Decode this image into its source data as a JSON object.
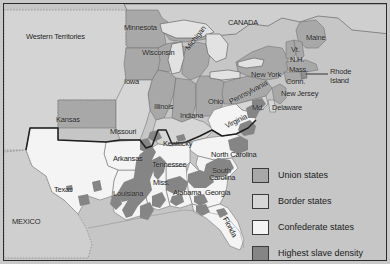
{
  "map": {
    "title": "Union, Border and Confederate States with Highest Slave Density",
    "colors": {
      "background": "#c9c9c9",
      "ocean": "#c6c6c6",
      "union": "#a8a8a8",
      "border": "#d6d6d6",
      "confederate": "#f2f2f2",
      "slave_density": "#8a8a8a",
      "territory": "#d4d4d4",
      "foreign": "#cfcfcf",
      "outline": "#4a4a4a",
      "heavy_outline": "#1f1f1f",
      "frame": "#2b2b2b",
      "text": "#1a1a1a"
    },
    "regions": [
      {
        "name": "Western Territories",
        "label": "Western Territories",
        "class": "territory"
      },
      {
        "name": "Canada",
        "label": "CANADA",
        "class": "foreign"
      },
      {
        "name": "Mexico",
        "label": "MEXICO",
        "class": "foreign"
      }
    ],
    "labels": [
      {
        "name": "western-territories",
        "text": "Western Territories",
        "x": 26,
        "y": 33,
        "size": 7.5,
        "rotate": 0
      },
      {
        "name": "canada",
        "text": "CANADA",
        "x": 228,
        "y": 19,
        "size": 7.5,
        "rotate": 0
      },
      {
        "name": "mexico",
        "text": "MEXICO",
        "x": 12,
        "y": 218,
        "size": 7.5,
        "rotate": 0
      },
      {
        "name": "minnesota",
        "text": "Minnesota",
        "x": 124,
        "y": 24,
        "size": 7.5,
        "rotate": 0
      },
      {
        "name": "wisconsin",
        "text": "Wisconsin",
        "x": 142,
        "y": 49,
        "size": 7.5,
        "rotate": 0
      },
      {
        "name": "michigan",
        "text": "Michigan",
        "x": 184,
        "y": 47,
        "size": 7.5,
        "rotate": -52
      },
      {
        "name": "iowa",
        "text": "Iowa",
        "x": 124,
        "y": 78,
        "size": 7.5,
        "rotate": 0
      },
      {
        "name": "illinois",
        "text": "Illinois",
        "x": 154,
        "y": 103,
        "size": 7.5,
        "rotate": 0
      },
      {
        "name": "indiana",
        "text": "Indiana",
        "x": 180,
        "y": 112,
        "size": 7.5,
        "rotate": 0
      },
      {
        "name": "ohio",
        "text": "Ohio",
        "x": 208,
        "y": 98,
        "size": 7.5,
        "rotate": 0
      },
      {
        "name": "kansas",
        "text": "Kansas",
        "x": 56,
        "y": 116,
        "size": 7.5,
        "rotate": 0
      },
      {
        "name": "missouri",
        "text": "Missouri",
        "x": 110,
        "y": 128,
        "size": 7.5,
        "rotate": 0
      },
      {
        "name": "kentucky",
        "text": "Kentucky",
        "x": 163,
        "y": 140,
        "size": 7.5,
        "rotate": 0
      },
      {
        "name": "tennessee",
        "text": "Tennessee",
        "x": 152,
        "y": 161,
        "size": 7.5,
        "rotate": 0
      },
      {
        "name": "arkansas",
        "text": "Arkansas",
        "x": 113,
        "y": 155,
        "size": 7.5,
        "rotate": 0
      },
      {
        "name": "texas",
        "text": "Texas",
        "x": 54,
        "y": 186,
        "size": 7.5,
        "rotate": 0
      },
      {
        "name": "louisiana",
        "text": "Louisiana",
        "x": 113,
        "y": 190,
        "size": 7.5,
        "rotate": 0
      },
      {
        "name": "mississippi",
        "text": "Miss.",
        "x": 153,
        "y": 179,
        "size": 7.5,
        "rotate": 0
      },
      {
        "name": "alabama",
        "text": "Alabama",
        "x": 173,
        "y": 189,
        "size": 7.5,
        "rotate": 0
      },
      {
        "name": "georgia",
        "text": "Georgia",
        "x": 205,
        "y": 189,
        "size": 7.5,
        "rotate": 0
      },
      {
        "name": "florida",
        "text": "Florida",
        "x": 228,
        "y": 216,
        "size": 7.5,
        "rotate": 62
      },
      {
        "name": "north-carolina",
        "text": "North Carolina",
        "x": 211,
        "y": 151,
        "size": 7.5,
        "rotate": 0
      },
      {
        "name": "south-carolina-line1",
        "text": "South",
        "x": 212,
        "y": 167,
        "size": 7.5,
        "rotate": 0
      },
      {
        "name": "south-carolina-line2",
        "text": "Carolina",
        "x": 209,
        "y": 174,
        "size": 7.5,
        "rotate": 0
      },
      {
        "name": "virginia",
        "text": "Virginia",
        "x": 224,
        "y": 123,
        "size": 7.5,
        "rotate": -26
      },
      {
        "name": "pennsylvania",
        "text": "Pennsylvania",
        "x": 228,
        "y": 99,
        "size": 7.5,
        "rotate": -28
      },
      {
        "name": "new-york",
        "text": "New York",
        "x": 251,
        "y": 71,
        "size": 7.5,
        "rotate": 0
      },
      {
        "name": "maine",
        "text": "Maine",
        "x": 306,
        "y": 34,
        "size": 7.5,
        "rotate": 0
      },
      {
        "name": "vermont",
        "text": "Vt.",
        "x": 291,
        "y": 46,
        "size": 7.5,
        "rotate": 0
      },
      {
        "name": "new-hampshire",
        "text": "N.H.",
        "x": 290,
        "y": 56,
        "size": 7.5,
        "rotate": 0
      },
      {
        "name": "massachusetts",
        "text": "Mass.",
        "x": 289,
        "y": 66,
        "size": 7.5,
        "rotate": 0
      },
      {
        "name": "connecticut",
        "text": "Conn.",
        "x": 286,
        "y": 78,
        "size": 7.5,
        "rotate": 0
      },
      {
        "name": "rhode-island-line1",
        "text": "Rhode",
        "x": 330,
        "y": 68,
        "size": 7.5,
        "rotate": 0
      },
      {
        "name": "rhode-island-line2",
        "text": "Island",
        "x": 330,
        "y": 77,
        "size": 7.5,
        "rotate": 0
      },
      {
        "name": "new-jersey",
        "text": "New Jersey",
        "x": 281,
        "y": 90,
        "size": 7.5,
        "rotate": 0
      },
      {
        "name": "maryland",
        "text": "Md.",
        "x": 252,
        "y": 104,
        "size": 7.5,
        "rotate": 0
      },
      {
        "name": "delaware",
        "text": "Delaware",
        "x": 272,
        "y": 104,
        "size": 7.5,
        "rotate": 0
      }
    ],
    "legend": {
      "name": "map-legend",
      "items": [
        {
          "name": "legend-union",
          "label": "Union states",
          "swatch": "#a8a8a8"
        },
        {
          "name": "legend-border",
          "label": "Border states",
          "swatch": "#d6d6d6"
        },
        {
          "name": "legend-confederate",
          "label": "Confederate states",
          "swatch": "#f4f4f4"
        },
        {
          "name": "legend-density",
          "label": "Highest slave density",
          "swatch": "#858585"
        }
      ]
    }
  }
}
